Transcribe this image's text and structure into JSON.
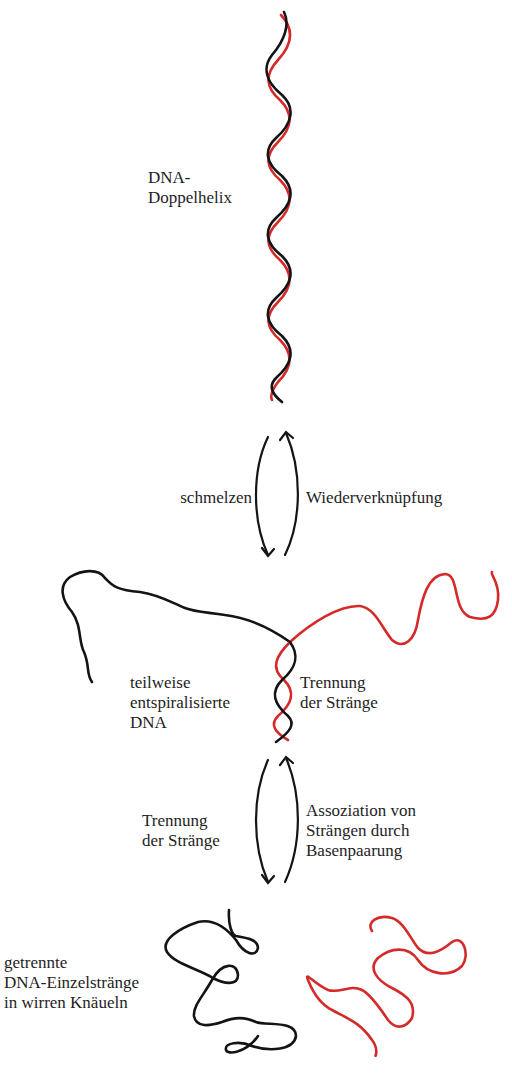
{
  "diagram": {
    "colors": {
      "strand_a": "#141414",
      "strand_b": "#d42a2a",
      "text": "#1e1e1e"
    },
    "stages": [
      {
        "id": "double-helix",
        "label_lines": [
          "DNA-",
          "Doppelhelix"
        ]
      },
      {
        "id": "partially-unwound",
        "label_lines": [
          "teilweise",
          "entspiralisierte",
          "DNA"
        ]
      },
      {
        "id": "separated-coils",
        "label_lines": [
          "getrennte",
          "DNA-Einzelstränge",
          "in wirren Knäueln"
        ]
      }
    ],
    "transitions": [
      {
        "id": "t1",
        "forward_label": [
          "schmelzen"
        ],
        "reverse_label": [
          "Wiederverknüpfung"
        ]
      },
      {
        "id": "t2",
        "forward_label": [
          "Trennung",
          "der Stränge"
        ],
        "reverse_label": [
          "Assoziation von",
          "Strängen durch",
          "Basenpaarung"
        ]
      }
    ],
    "annotations": [
      {
        "id": "strand-separation",
        "label_lines": [
          "Trennung",
          "der Stränge"
        ]
      }
    ]
  }
}
